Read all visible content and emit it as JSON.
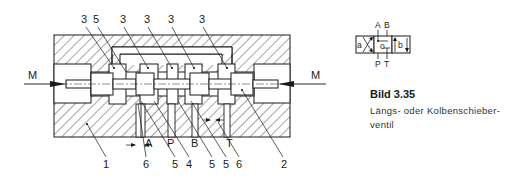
{
  "diagram": {
    "type": "spool-valve-cross-section",
    "colors": {
      "ink": "#1a1a1a",
      "background": "#ffffff"
    },
    "force_labels": {
      "left": "M",
      "right": "M"
    },
    "callouts_top": [
      "3",
      "5",
      "3",
      "3",
      "3",
      "3"
    ],
    "callouts_bottom": [
      "1",
      "6",
      "5",
      "4",
      "5",
      "5",
      "6",
      "2"
    ],
    "port_labels": {
      "a": "A",
      "p": "P",
      "b": "B",
      "t": "T"
    }
  },
  "symbol": {
    "top_ports": {
      "a": "A",
      "b": "B"
    },
    "bottom_ports": {
      "p": "P",
      "t": "T"
    },
    "positions": {
      "left": "a",
      "center": "o",
      "right": "b"
    }
  },
  "caption": {
    "figure": "Bild 3.35",
    "text_line1": "Längs- oder Kolbenschieber-",
    "text_line2": "ventil"
  }
}
